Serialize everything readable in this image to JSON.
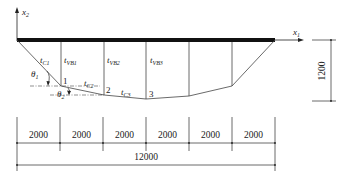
{
  "diagram": {
    "axes": {
      "x1": {
        "label": "x",
        "sub": "1"
      },
      "x2": {
        "label": "x",
        "sub": "2"
      }
    },
    "members": [
      {
        "label": "t",
        "sub": "C1"
      },
      {
        "label": "t",
        "sub": "VB1"
      },
      {
        "label": "t",
        "sub": "VB2"
      },
      {
        "label": "t",
        "sub": "VB3"
      },
      {
        "label": "t",
        "sub": "C2"
      },
      {
        "label": "t",
        "sub": "C3"
      }
    ],
    "angles": [
      {
        "label": "θ",
        "sub": "1"
      },
      {
        "label": "θ",
        "sub": "2"
      }
    ],
    "nodes": [
      "1",
      "2",
      "3"
    ],
    "dimensions": {
      "height": "1200",
      "spans": [
        "2000",
        "2000",
        "2000",
        "2000",
        "2000",
        "2000"
      ],
      "total": "12000"
    }
  }
}
